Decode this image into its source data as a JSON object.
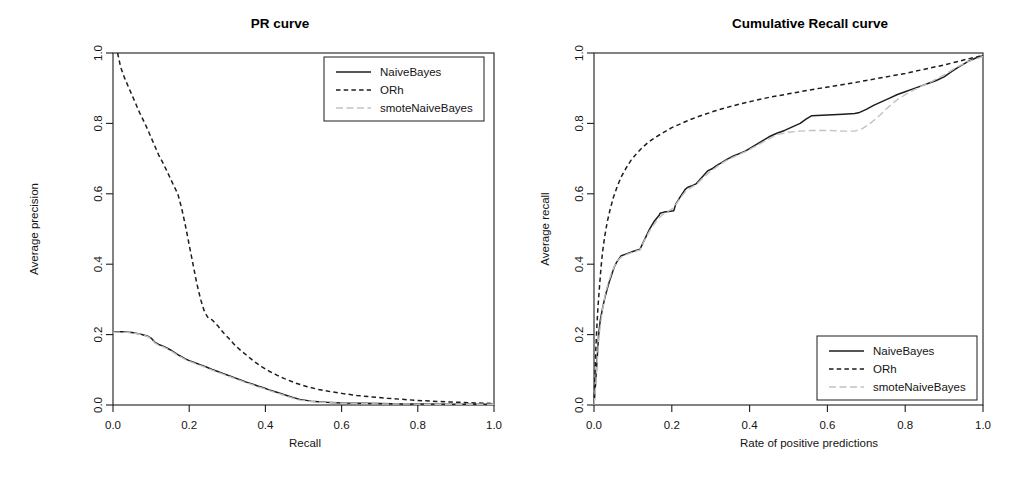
{
  "figure": {
    "width": 1031,
    "height": 497,
    "background": "#ffffff",
    "foreground": "#1a1a1a"
  },
  "chart_data": [
    {
      "type": "line",
      "id": "pr-curve",
      "title": "PR curve",
      "xlabel": "Recall",
      "ylabel": "Average precision",
      "xlim": [
        0,
        1
      ],
      "ylim": [
        0,
        1
      ],
      "xticks": [
        0.0,
        0.2,
        0.4,
        0.6,
        0.8,
        1.0
      ],
      "yticks": [
        0.0,
        0.2,
        0.4,
        0.6,
        0.8,
        1.0
      ],
      "xticklabels": [
        "0.0",
        "0.2",
        "0.4",
        "0.6",
        "0.8",
        "1.0"
      ],
      "yticklabels": [
        "0.0",
        "0.2",
        "0.4",
        "0.6",
        "0.8",
        "1.0"
      ],
      "grid": false,
      "legend_position": "top-right",
      "series": [
        {
          "name": "NaiveBayes",
          "style": "solid",
          "color": "#1d1d1d",
          "width": 1.5,
          "x": [
            0.0,
            0.01,
            0.02,
            0.03,
            0.04,
            0.05,
            0.06,
            0.07,
            0.08,
            0.09,
            0.1,
            0.11,
            0.12,
            0.13,
            0.14,
            0.15,
            0.16,
            0.17,
            0.18,
            0.19,
            0.2,
            0.215,
            0.23,
            0.245,
            0.26,
            0.275,
            0.29,
            0.305,
            0.32,
            0.335,
            0.35,
            0.365,
            0.38,
            0.395,
            0.41,
            0.43,
            0.45,
            0.47,
            0.49,
            0.52,
            0.56,
            0.6,
            0.65,
            0.7,
            0.76,
            0.82,
            0.88,
            0.94,
            1.0
          ],
          "y": [
            0.207,
            0.208,
            0.208,
            0.208,
            0.207,
            0.206,
            0.204,
            0.202,
            0.199,
            0.196,
            0.19,
            0.178,
            0.172,
            0.168,
            0.163,
            0.157,
            0.15,
            0.143,
            0.137,
            0.131,
            0.126,
            0.12,
            0.114,
            0.108,
            0.101,
            0.095,
            0.089,
            0.083,
            0.077,
            0.071,
            0.065,
            0.06,
            0.054,
            0.049,
            0.043,
            0.036,
            0.029,
            0.022,
            0.016,
            0.011,
            0.008,
            0.006,
            0.005,
            0.004,
            0.003,
            0.003,
            0.002,
            0.002,
            0.002
          ]
        },
        {
          "name": "ORh",
          "style": "dashed",
          "color": "#1d1d1d",
          "width": 1.5,
          "x": [
            0.012,
            0.02,
            0.03,
            0.04,
            0.05,
            0.06,
            0.07,
            0.08,
            0.09,
            0.1,
            0.11,
            0.12,
            0.13,
            0.14,
            0.15,
            0.16,
            0.17,
            0.18,
            0.19,
            0.2,
            0.21,
            0.22,
            0.23,
            0.24,
            0.25,
            0.26,
            0.275,
            0.29,
            0.305,
            0.32,
            0.335,
            0.35,
            0.37,
            0.39,
            0.41,
            0.43,
            0.45,
            0.48,
            0.51,
            0.54,
            0.57,
            0.6,
            0.64,
            0.68,
            0.72,
            0.76,
            0.8,
            0.85,
            0.9,
            0.95,
            1.0
          ],
          "y": [
            1.0,
            0.96,
            0.93,
            0.905,
            0.88,
            0.855,
            0.83,
            0.808,
            0.785,
            0.76,
            0.735,
            0.71,
            0.69,
            0.668,
            0.645,
            0.622,
            0.6,
            0.56,
            0.51,
            0.455,
            0.4,
            0.345,
            0.3,
            0.265,
            0.247,
            0.242,
            0.225,
            0.205,
            0.188,
            0.17,
            0.155,
            0.142,
            0.124,
            0.109,
            0.096,
            0.085,
            0.075,
            0.062,
            0.052,
            0.044,
            0.038,
            0.033,
            0.027,
            0.023,
            0.019,
            0.016,
            0.013,
            0.01,
            0.008,
            0.006,
            0.004
          ]
        },
        {
          "name": "smoteNaiveBayes",
          "style": "dotdash-light",
          "color": "#c2c2c2",
          "width": 1.4,
          "x": [
            0.0,
            0.01,
            0.02,
            0.03,
            0.04,
            0.05,
            0.06,
            0.07,
            0.08,
            0.09,
            0.1,
            0.11,
            0.12,
            0.13,
            0.14,
            0.15,
            0.16,
            0.17,
            0.18,
            0.19,
            0.2,
            0.215,
            0.23,
            0.245,
            0.26,
            0.275,
            0.29,
            0.305,
            0.32,
            0.335,
            0.35,
            0.365,
            0.38,
            0.395,
            0.41,
            0.43,
            0.45,
            0.47,
            0.49,
            0.52,
            0.56,
            0.6,
            0.65,
            0.7,
            0.76,
            0.82,
            0.88,
            0.94,
            1.0
          ],
          "y": [
            0.206,
            0.207,
            0.207,
            0.207,
            0.206,
            0.205,
            0.203,
            0.201,
            0.198,
            0.195,
            0.188,
            0.176,
            0.17,
            0.166,
            0.161,
            0.155,
            0.148,
            0.141,
            0.135,
            0.129,
            0.124,
            0.118,
            0.112,
            0.106,
            0.099,
            0.093,
            0.087,
            0.081,
            0.075,
            0.069,
            0.063,
            0.058,
            0.052,
            0.047,
            0.041,
            0.034,
            0.027,
            0.02,
            0.014,
            0.01,
            0.007,
            0.005,
            0.004,
            0.003,
            0.003,
            0.002,
            0.002,
            0.002,
            0.002
          ]
        }
      ]
    },
    {
      "type": "line",
      "id": "cumulative-recall-curve",
      "title": "Cumulative Recall curve",
      "xlabel": "Rate of positive predictions",
      "ylabel": "Average recall",
      "xlim": [
        0,
        1
      ],
      "ylim": [
        0,
        1
      ],
      "xticks": [
        0.0,
        0.2,
        0.4,
        0.6,
        0.8,
        1.0
      ],
      "yticks": [
        0.0,
        0.2,
        0.4,
        0.6,
        0.8,
        1.0
      ],
      "xticklabels": [
        "0.0",
        "0.2",
        "0.4",
        "0.6",
        "0.8",
        "1.0"
      ],
      "yticklabels": [
        "0.0",
        "0.2",
        "0.4",
        "0.6",
        "0.8",
        "1.0"
      ],
      "grid": false,
      "legend_position": "bottom-right",
      "series": [
        {
          "name": "NaiveBayes",
          "style": "solid",
          "color": "#1d1d1d",
          "width": 1.5,
          "x": [
            0.0,
            0.004,
            0.008,
            0.012,
            0.016,
            0.022,
            0.028,
            0.034,
            0.04,
            0.046,
            0.052,
            0.058,
            0.064,
            0.07,
            0.08,
            0.09,
            0.1,
            0.11,
            0.118,
            0.118,
            0.13,
            0.142,
            0.155,
            0.168,
            0.17,
            0.18,
            0.192,
            0.205,
            0.21,
            0.222,
            0.234,
            0.24,
            0.25,
            0.262,
            0.272,
            0.28,
            0.292,
            0.305,
            0.315,
            0.33,
            0.345,
            0.36,
            0.375,
            0.39,
            0.405,
            0.42,
            0.435,
            0.45,
            0.47,
            0.49,
            0.51,
            0.53,
            0.545,
            0.56,
            0.6,
            0.64,
            0.67,
            0.68,
            0.7,
            0.72,
            0.74,
            0.76,
            0.78,
            0.8,
            0.82,
            0.84,
            0.86,
            0.88,
            0.9,
            0.92,
            0.94,
            0.96,
            0.98,
            1.0
          ],
          "y": [
            0.0,
            0.06,
            0.13,
            0.2,
            0.24,
            0.275,
            0.305,
            0.33,
            0.352,
            0.372,
            0.392,
            0.405,
            0.415,
            0.424,
            0.428,
            0.432,
            0.436,
            0.44,
            0.442,
            0.442,
            0.47,
            0.498,
            0.522,
            0.54,
            0.545,
            0.548,
            0.55,
            0.552,
            0.57,
            0.592,
            0.612,
            0.618,
            0.622,
            0.628,
            0.64,
            0.65,
            0.665,
            0.672,
            0.68,
            0.69,
            0.7,
            0.708,
            0.715,
            0.722,
            0.732,
            0.742,
            0.752,
            0.762,
            0.772,
            0.78,
            0.79,
            0.8,
            0.812,
            0.822,
            0.824,
            0.826,
            0.828,
            0.83,
            0.84,
            0.852,
            0.862,
            0.872,
            0.882,
            0.89,
            0.898,
            0.906,
            0.914,
            0.922,
            0.932,
            0.948,
            0.962,
            0.975,
            0.985,
            0.992
          ]
        },
        {
          "name": "ORh",
          "style": "dashed",
          "color": "#1d1d1d",
          "width": 1.5,
          "x": [
            0.0,
            0.001,
            0.002,
            0.003,
            0.004,
            0.006,
            0.008,
            0.01,
            0.014,
            0.018,
            0.022,
            0.028,
            0.034,
            0.042,
            0.05,
            0.06,
            0.07,
            0.082,
            0.095,
            0.11,
            0.125,
            0.14,
            0.16,
            0.18,
            0.2,
            0.225,
            0.25,
            0.28,
            0.31,
            0.34,
            0.375,
            0.41,
            0.45,
            0.49,
            0.53,
            0.57,
            0.61,
            0.65,
            0.7,
            0.75,
            0.8,
            0.85,
            0.9,
            0.95,
            1.0
          ],
          "y": [
            0.0,
            0.035,
            0.07,
            0.105,
            0.14,
            0.19,
            0.235,
            0.275,
            0.335,
            0.39,
            0.435,
            0.482,
            0.52,
            0.558,
            0.59,
            0.622,
            0.648,
            0.672,
            0.695,
            0.715,
            0.732,
            0.747,
            0.762,
            0.775,
            0.788,
            0.8,
            0.812,
            0.824,
            0.835,
            0.845,
            0.855,
            0.864,
            0.874,
            0.882,
            0.89,
            0.898,
            0.905,
            0.912,
            0.922,
            0.932,
            0.942,
            0.954,
            0.966,
            0.98,
            0.993
          ]
        },
        {
          "name": "smoteNaiveBayes",
          "style": "dotdash-light",
          "color": "#c2c2c2",
          "width": 1.4,
          "x": [
            0.0,
            0.004,
            0.008,
            0.012,
            0.018,
            0.024,
            0.03,
            0.038,
            0.046,
            0.054,
            0.062,
            0.07,
            0.08,
            0.09,
            0.1,
            0.11,
            0.118,
            0.13,
            0.145,
            0.16,
            0.175,
            0.19,
            0.205,
            0.22,
            0.235,
            0.25,
            0.265,
            0.28,
            0.295,
            0.31,
            0.33,
            0.35,
            0.37,
            0.39,
            0.41,
            0.43,
            0.45,
            0.47,
            0.5,
            0.53,
            0.56,
            0.6,
            0.64,
            0.67,
            0.69,
            0.71,
            0.73,
            0.75,
            0.78,
            0.81,
            0.84,
            0.87,
            0.9,
            0.93,
            0.96,
            1.0
          ],
          "y": [
            0.0,
            0.05,
            0.118,
            0.185,
            0.24,
            0.285,
            0.32,
            0.352,
            0.378,
            0.398,
            0.412,
            0.42,
            0.426,
            0.43,
            0.434,
            0.438,
            0.44,
            0.468,
            0.498,
            0.522,
            0.54,
            0.55,
            0.56,
            0.585,
            0.606,
            0.618,
            0.628,
            0.645,
            0.66,
            0.672,
            0.688,
            0.7,
            0.71,
            0.72,
            0.732,
            0.744,
            0.756,
            0.768,
            0.775,
            0.778,
            0.78,
            0.78,
            0.778,
            0.778,
            0.785,
            0.8,
            0.818,
            0.84,
            0.868,
            0.888,
            0.905,
            0.92,
            0.938,
            0.958,
            0.975,
            0.99
          ]
        }
      ]
    }
  ],
  "legend": {
    "entries": [
      "NaiveBayes",
      "ORh",
      "smoteNaiveBayes"
    ]
  }
}
